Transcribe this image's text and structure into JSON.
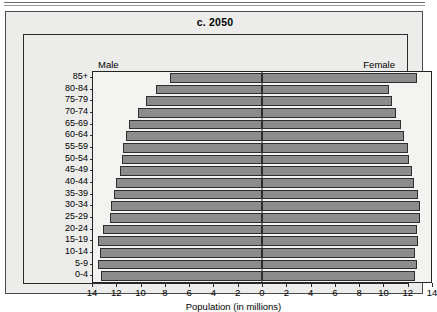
{
  "chart_data": {
    "type": "bar",
    "subtype": "population-pyramid",
    "title": "c. 2050",
    "xlabel": "Population (in millions)",
    "ylabel": "",
    "grid": false,
    "legend_position": "inside-top",
    "axis_max": 14,
    "xlim": [
      -14,
      14
    ],
    "xticks": [
      14,
      12,
      10,
      8,
      6,
      4,
      2,
      0,
      2,
      4,
      6,
      8,
      10,
      12,
      14
    ],
    "left_series_name": "Male",
    "right_series_name": "Female",
    "categories": [
      "85+",
      "80-84",
      "75-79",
      "70-74",
      "65-69",
      "60-64",
      "55-59",
      "50-54",
      "45-49",
      "40-44",
      "35-39",
      "30-34",
      "25-29",
      "20-24",
      "15-19",
      "10-14",
      "5-9",
      "0-4"
    ],
    "series": [
      {
        "name": "Male",
        "values": [
          7.6,
          8.8,
          9.6,
          10.3,
          11.0,
          11.3,
          11.5,
          11.6,
          11.8,
          12.1,
          12.3,
          12.5,
          12.6,
          13.2,
          13.6,
          13.4,
          13.6,
          13.3
        ]
      },
      {
        "name": "Female",
        "values": [
          12.8,
          10.5,
          10.8,
          11.1,
          11.5,
          11.8,
          12.1,
          12.2,
          12.4,
          12.6,
          12.9,
          13.1,
          13.1,
          12.8,
          12.9,
          12.7,
          12.8,
          12.7
        ]
      }
    ]
  },
  "panel": {
    "title": "c. 2050",
    "male_label": "Male",
    "female_label": "Female",
    "xaxis_title": "Population (in millions)"
  },
  "colors": {
    "bar_fill": "#8c8c8c",
    "bar_stroke": "#2e2e2e",
    "panel_bg": "#ececeb",
    "plot_bg": "#f3f3f2",
    "frame": "#2b2b2b",
    "text": "#000000"
  }
}
